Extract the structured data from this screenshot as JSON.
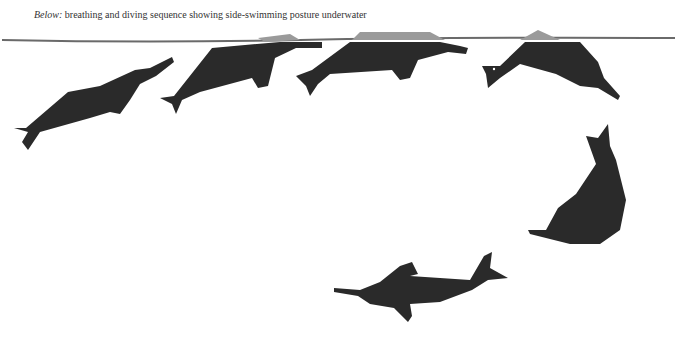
{
  "caption": {
    "label": "Below:",
    "text": "breathing and diving sequence showing side-swimming posture underwater"
  },
  "illustration": {
    "subject": "river dolphin silhouettes",
    "figures": [
      "dolphin-1-ascending",
      "dolphin-2-surfacing",
      "dolphin-3-breathing",
      "dolphin-4-diving",
      "dolphin-5-descending",
      "dolphin-6-side-swimming"
    ],
    "colors": {
      "silhouette": "#2a2a2a",
      "above_water": "#9a9a9a",
      "waterline": "#6a6a6a"
    }
  }
}
